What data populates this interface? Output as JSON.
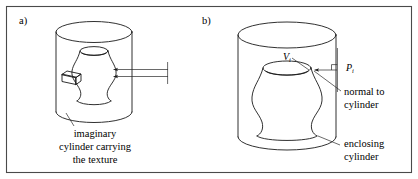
{
  "figure": {
    "background_color": "#ffffff",
    "ink_color": "#1a1a1a",
    "frame_color": "#4a4a4a",
    "width": 418,
    "height": 179
  },
  "panels": [
    {
      "id": "a",
      "label": "a)",
      "caption_lines": [
        "imaginary",
        "cylinder carrying",
        "the texture"
      ],
      "shapes": {
        "outer_cylinder": "enclosing-cylinder",
        "inner_object": "vase-shaped-solid",
        "texture_block": "small-3d-box",
        "arrows": 2,
        "arrow_direction": "left"
      }
    },
    {
      "id": "b",
      "label": "b)",
      "caption_lines_normal": [
        "normal to",
        "cylinder"
      ],
      "caption_lines_enclosing": [
        "enclosing",
        "cylinder"
      ],
      "math_labels": [
        {
          "name": "vertex-label",
          "base": "V",
          "sub": "i"
        },
        {
          "name": "point-label",
          "base": "P",
          "sub": "i"
        }
      ],
      "shapes": {
        "outer_cylinder": "enclosing-cylinder",
        "inner_object": "vase-shaped-solid",
        "normal_arrow": "leftward-arrow",
        "right_angle_marker": true
      }
    }
  ]
}
